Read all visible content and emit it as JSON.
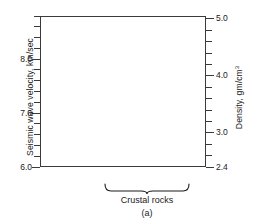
{
  "figure": {
    "panel_label": "(a)",
    "group_label": "Crustal rocks",
    "top_clipped_text": ""
  },
  "axes": {
    "left": {
      "title": "Seismic wave velocity, km/sec",
      "ticks": [
        "6.0",
        "7.0",
        "8.0"
      ],
      "minor_step": 0.2,
      "range": [
        6.0,
        8.8
      ]
    },
    "right": {
      "title_main": "Density, gm/cm",
      "title_sup": "3",
      "ticks": [
        "2.4",
        "3.0",
        "4.0",
        "5.0"
      ],
      "range": [
        2.4,
        5.05
      ]
    }
  },
  "categories": [
    {
      "label": "Mantle"
    },
    {
      "label": "Granite"
    },
    {
      "label": "Basalt"
    }
  ],
  "colors": {
    "velocity_mantle": "#4d4d4d",
    "density_mantle": "#262626",
    "velocity_crust": "#b3b3b3",
    "density_crust": "#b3b3b3",
    "axis": "#3a3a3a",
    "background": "#ffffff"
  },
  "chart_data": {
    "type": "bar",
    "title": "",
    "xlabel": "",
    "ylabel": "Seismic wave velocity, km/sec",
    "y2label": "Density, gm/cm^3",
    "categories": [
      "Mantle",
      "Granite",
      "Basalt"
    ],
    "series": [
      {
        "name": "Seismic wave velocity",
        "unit": "km/sec",
        "axis": "left",
        "values": [
          8.25,
          6.5,
          6.75
        ]
      },
      {
        "name": "Density",
        "unit": "gm/cm^3",
        "axis": "right",
        "values": [
          3.4,
          2.65,
          2.95
        ]
      }
    ],
    "ylim": [
      6.0,
      8.8
    ],
    "y2lim": [
      2.4,
      5.05
    ],
    "yticks": [
      6.0,
      7.0,
      8.0
    ],
    "y2ticks": [
      2.4,
      3.0,
      4.0,
      5.0
    ],
    "grid": false,
    "legend": "none",
    "annotations": [
      {
        "text": "Crustal rocks",
        "covers": [
          "Granite",
          "Basalt"
        ]
      },
      {
        "text": "(a)",
        "position": "below"
      }
    ]
  }
}
